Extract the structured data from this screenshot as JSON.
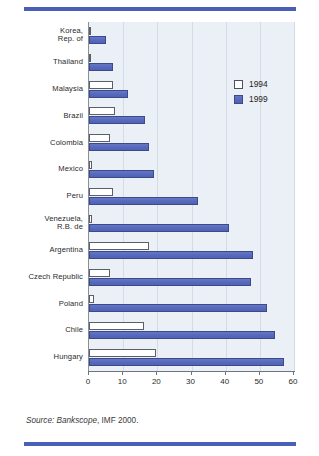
{
  "legend": {
    "position": "top-right",
    "entries": [
      {
        "label": "1994",
        "swatch": "white-square-swatch",
        "color": "#ffffff"
      },
      {
        "label": "1999",
        "swatch": "blue-square-swatch",
        "color": "#5a6fc0"
      }
    ]
  },
  "source": {
    "prefix": "Source:",
    "database": " Bankscope",
    "rest": ", IMF 2000."
  },
  "decor": {
    "rule_color": "#4a5fb8"
  },
  "chart_data": {
    "type": "bar",
    "orientation": "horizontal",
    "title": "",
    "subtitle": "",
    "xlabel": "",
    "ylabel": "",
    "xlim": [
      0,
      60
    ],
    "ylim": null,
    "xticks": [
      0,
      10,
      20,
      30,
      40,
      50,
      60
    ],
    "xtick_labels": [
      "0",
      "10",
      "20",
      "30",
      "40",
      "50",
      "60"
    ],
    "grid": "vertical",
    "legend_position": "top-right",
    "plot_background": "#eaf0f6",
    "categories": [
      "Korea,\nRep. of",
      "Thailand",
      "Malaysia",
      "Brazil",
      "Colombia",
      "Mexico",
      "Peru",
      "Venezuela,\nR.B. de",
      "Argentina",
      "Czech Republic",
      "Poland",
      "Chile",
      "Hungary"
    ],
    "category_labels": [
      [
        "Korea,",
        "Rep. of"
      ],
      [
        "Thailand"
      ],
      [
        "Malaysia"
      ],
      [
        "Brazil"
      ],
      [
        "Colombia"
      ],
      [
        "Mexico"
      ],
      [
        "Peru"
      ],
      [
        "Venezuela,",
        "R.B. de"
      ],
      [
        "Argentina"
      ],
      [
        "Czech Republic"
      ],
      [
        "Poland"
      ],
      [
        "Chile"
      ],
      [
        "Hungary"
      ]
    ],
    "series": [
      {
        "name": "1994",
        "color": "#ffffff",
        "edge_color": "#5a5f6a",
        "values": [
          0.5,
          0.6,
          7.0,
          7.5,
          6.0,
          1.0,
          7.0,
          1.0,
          17.5,
          6.0,
          1.5,
          16.0,
          19.5
        ]
      },
      {
        "name": "1999",
        "color": "#5a6fc0",
        "edge_color": "#3c4a88",
        "values": [
          5.0,
          7.0,
          11.5,
          16.5,
          17.5,
          19.0,
          32.0,
          41.0,
          48.0,
          47.5,
          52.0,
          54.5,
          57.0
        ]
      }
    ]
  }
}
